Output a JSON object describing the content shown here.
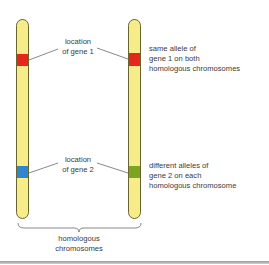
{
  "colors": {
    "chromosome_fill": "#f6ec8a",
    "chromosome_outline": "#6a6530",
    "gene1_allele": "#e8251b",
    "gene2_allele_left": "#2f86cf",
    "gene2_allele_right": "#7aa51e",
    "leader_line": "#555555",
    "text": "#3a3a3a"
  },
  "chromosomes": [
    {
      "id": "left",
      "gene1_color": "#e8251b",
      "gene2_color": "#2f86cf"
    },
    {
      "id": "right",
      "gene1_color": "#e8251b",
      "gene2_color": "#7aa51e"
    }
  ],
  "labels": {
    "gene1_location": {
      "line1": "location",
      "line2": "of gene 1"
    },
    "gene2_location": {
      "line1": "location",
      "line2": "of gene 2"
    },
    "gene1_note": {
      "line1": "same allele of",
      "line2": "gene 1 on both",
      "line3": "homologous chromosomes"
    },
    "gene2_note": {
      "line1": "different alleles of",
      "line2": "gene 2 on each",
      "line3": "homologous chromosome"
    },
    "pair": {
      "line1": "homologous",
      "line2": "chromosomes"
    }
  }
}
